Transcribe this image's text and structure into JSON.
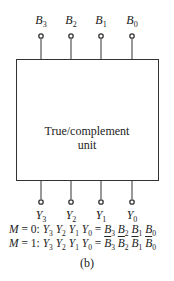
{
  "diagram": {
    "inputs": [
      "B3",
      "B2",
      "B1",
      "B0"
    ],
    "outputs": [
      "Y3",
      "Y2",
      "Y1",
      "Y0"
    ],
    "unit_label_line1": "True/complement",
    "unit_label_line2": "unit",
    "equations": [
      "M = 0: Y3 Y2 Y1 Y0 = B3 B2 B1 B0",
      "M = 1: Y3 Y2 Y1 Y0 = B̄3 B̄2 B̄1 B̄0"
    ],
    "caption": "(b)"
  }
}
